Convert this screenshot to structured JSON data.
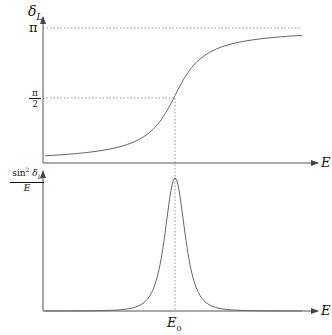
{
  "top_plot": {
    "y_label": "δ_L",
    "y_label_main": "δ",
    "y_label_sub": "L",
    "x_label": "E",
    "ticks": [
      {
        "label": "π",
        "value": 3.14159
      },
      {
        "label_num": "π",
        "label_den": "2",
        "value": 1.5708
      }
    ],
    "curve": "arctan step rising from 0 to π, crossing π/2 at E0"
  },
  "bottom_plot": {
    "y_label_num": "sin² δ_L",
    "y_label_num_main": "sin",
    "y_label_num_sup": "2",
    "y_label_num_delta": "δ",
    "y_label_num_sub": "L",
    "y_label_den": "E",
    "x_label": "E",
    "x_tick": "E",
    "x_tick_sub": "0",
    "curve": "Lorentzian resonance peak centered at E0"
  },
  "colors": {
    "axis": "#555555",
    "curve": "#666666",
    "guide": "#777777",
    "text": "#111111"
  }
}
